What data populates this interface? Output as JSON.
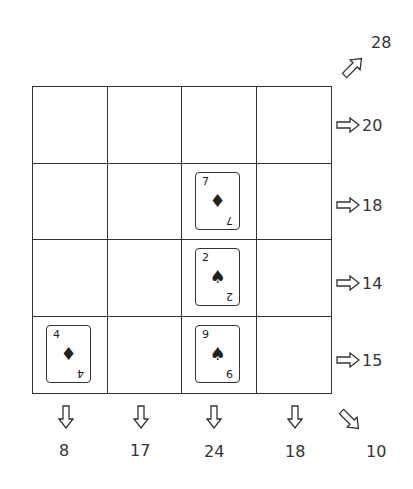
{
  "puzzle": {
    "grid_size": 4,
    "cards": [
      {
        "row": 1,
        "col": 2,
        "rank": "7",
        "suit": "♦",
        "suit_name": "diamond"
      },
      {
        "row": 2,
        "col": 2,
        "rank": "2",
        "suit": "♠",
        "suit_name": "spade"
      },
      {
        "row": 3,
        "col": 0,
        "rank": "4",
        "suit": "♦",
        "suit_name": "diamond"
      },
      {
        "row": 3,
        "col": 2,
        "rank": "9",
        "suit": "♠",
        "suit_name": "spade"
      }
    ],
    "row_sums": [
      "20",
      "18",
      "14",
      "15"
    ],
    "col_sums": [
      "8",
      "17",
      "24",
      "18"
    ],
    "diag_up_sum": "28",
    "diag_down_sum": "10"
  }
}
